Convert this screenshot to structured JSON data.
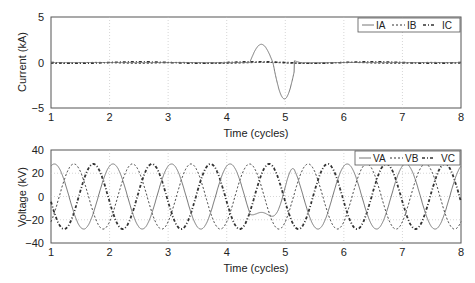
{
  "chart_data": [
    {
      "type": "line",
      "title": "",
      "xlabel": "Time (cycles)",
      "ylabel": "Current (kA)",
      "xlim": [
        1,
        8
      ],
      "ylim": [
        -5,
        5
      ],
      "xticks": [
        "1",
        "2",
        "3",
        "4",
        "5",
        "6",
        "7",
        "8"
      ],
      "yticks": [
        "5",
        "0",
        "−5"
      ],
      "grid": true,
      "legend_position": "top-right",
      "series": [
        {
          "name": "IA",
          "style": "solid",
          "description": "near 0 except fault transient 4.4-5.15 cycles",
          "points": [
            [
              1,
              0
            ],
            [
              4.4,
              0
            ],
            [
              4.45,
              2.0
            ],
            [
              4.6,
              1.0
            ],
            [
              4.87,
              -4.0
            ],
            [
              5.0,
              -2.5
            ],
            [
              5.15,
              0.2
            ],
            [
              5.2,
              0
            ],
            [
              8,
              0
            ]
          ]
        },
        {
          "name": "IB",
          "style": "dashed",
          "points": [
            [
              1,
              0
            ],
            [
              8,
              0
            ]
          ]
        },
        {
          "name": "IC",
          "style": "dash-dot",
          "points": [
            [
              1,
              0
            ],
            [
              8,
              0
            ]
          ]
        }
      ]
    },
    {
      "type": "line",
      "title": "",
      "xlabel": "Time (cycles)",
      "ylabel": "Voltage (kV)",
      "xlim": [
        1,
        8
      ],
      "ylim": [
        -40,
        40
      ],
      "xticks": [
        "1",
        "2",
        "3",
        "4",
        "5",
        "6",
        "7",
        "8"
      ],
      "yticks": [
        "40",
        "20",
        "0",
        "−20",
        "−40"
      ],
      "grid": true,
      "legend_position": "top-right",
      "series": [
        {
          "name": "VA",
          "style": "solid",
          "amplitude": 28,
          "phase_deg": 0,
          "description": "sinusoid, distorted/sagged 4.4-5.15 cycles (min ~-17 at 4.85)"
        },
        {
          "name": "VB",
          "style": "dashed",
          "amplitude": 28,
          "phase_deg": -120
        },
        {
          "name": "VC",
          "style": "dash-dot",
          "amplitude": 28,
          "phase_deg": 120
        }
      ]
    }
  ],
  "top": {
    "ylabel": "Current (kA)",
    "xlabel": "Time (cycles)",
    "legend": [
      "IA",
      "IB",
      "IC"
    ]
  },
  "bottom": {
    "ylabel": "Voltage (kV)",
    "xlabel": "Time (cycles)",
    "legend": [
      "VA",
      "VB",
      "VC"
    ]
  }
}
